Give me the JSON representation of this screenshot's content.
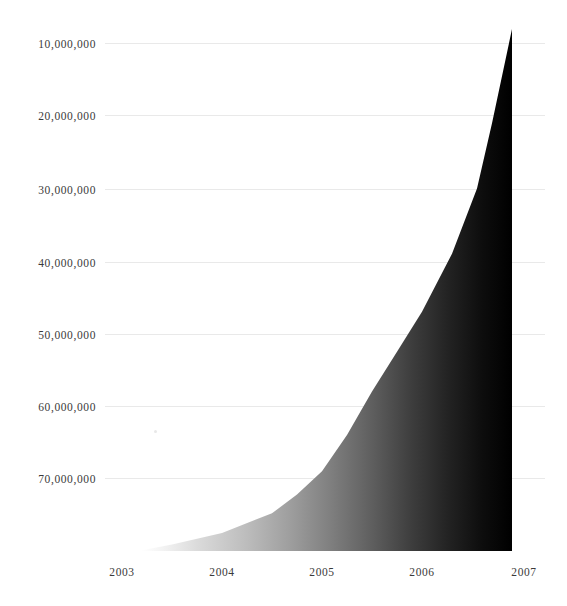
{
  "chart_data": {
    "type": "area",
    "title": "",
    "subtitle": "",
    "xlabel": "",
    "ylabel": "",
    "grid": true,
    "legend": "none",
    "xlim": [
      2002.78,
      2007.22
    ],
    "ylim": [
      0,
      75000000
    ],
    "x_tick_labels": [
      "2003",
      "2004",
      "2005",
      "2006",
      "2007"
    ],
    "x_tick_values": [
      2003,
      2004,
      2005,
      2006,
      2007
    ],
    "y_tick_labels": [
      "10,000,000",
      "20,000,000",
      "30,000,000",
      "40,000,000",
      "50,000,000",
      "60,000,000",
      "70,000,000"
    ],
    "y_tick_values": [
      10000000,
      20000000,
      30000000,
      40000000,
      50000000,
      60000000,
      70000000
    ],
    "series": [
      {
        "name": "",
        "x": [
          2003.2,
          2003.5,
          2004.0,
          2004.5,
          2004.75,
          2005.0,
          2005.25,
          2005.5,
          2005.75,
          2006.0,
          2006.3,
          2006.55,
          2006.7,
          2006.9
        ],
        "values": [
          100000,
          900000,
          2500000,
          5200000,
          7800000,
          11000000,
          16000000,
          22000000,
          27500000,
          33000000,
          41000000,
          50000000,
          59000000,
          72000000
        ]
      }
    ],
    "fill_style": "horizontal-gradient",
    "fill_color_left": "#ffffff",
    "fill_color_right": "#000000",
    "gridline_color": "#e9e9e9",
    "tick_label_color": "#3a3a3a",
    "background_color": "#ffffff"
  },
  "geometry": {
    "plot_left": 105,
    "plot_right": 545,
    "baseline_y": 551,
    "pixels_per_million": 7.25,
    "x_per_year": 100,
    "x_of_2003": 122,
    "gridlines_y": [
      43,
      115,
      189,
      262,
      334,
      406,
      478
    ],
    "ytick_label_right": 96,
    "xtick_label_y": 566,
    "xtick_label_x": [
      122,
      222,
      322,
      422,
      524
    ],
    "area_points_px": "145,551 222,533 273,513 322,471 375,392 422,312 478,189 511,29 511,551",
    "speck": {
      "x": 154,
      "y": 430
    }
  }
}
